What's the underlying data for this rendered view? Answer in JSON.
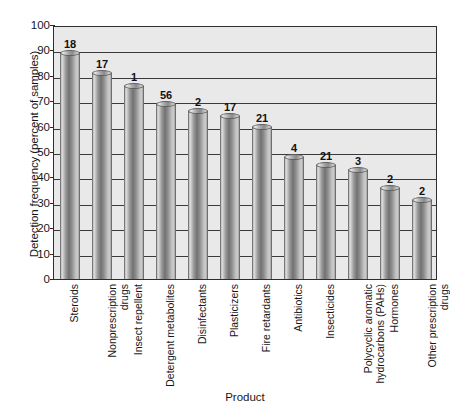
{
  "chart_data": {
    "type": "bar",
    "title": "",
    "xlabel": "Product",
    "ylabel": "Detection frequency (percent of samples)",
    "ylim": [
      0,
      100
    ],
    "ytick_labels": [
      "100",
      "90",
      "80",
      "70",
      "60",
      "50",
      "40",
      "30",
      "20",
      "10",
      "0"
    ],
    "ytick_values": [
      100,
      90,
      80,
      70,
      60,
      50,
      40,
      30,
      20,
      10,
      0
    ],
    "grid": true,
    "legend": null,
    "categories": [
      "Steroids",
      "Nonprescription drugs",
      "Insect repellent",
      "Detergent metabolites",
      "Disinfectants",
      "Plasticizers",
      "Fire retardants",
      "Antibiotics",
      "Insecticides",
      "Polycyclic aromatic hydrocarbons (PAHs)",
      "Hormones",
      "Other prescription drugs"
    ],
    "category_lines": [
      [
        "Steroids"
      ],
      [
        "Nonprescription",
        "drugs"
      ],
      [
        "Insect repellent"
      ],
      [
        "Detergent metabolites"
      ],
      [
        "Disinfectants"
      ],
      [
        "Plasticizers"
      ],
      [
        "Fire retardants"
      ],
      [
        "Antibiotics"
      ],
      [
        "Insecticides"
      ],
      [
        "Polycyclic aromatic",
        "hydrocarbons (PAHs)"
      ],
      [
        "Hormones"
      ],
      [
        "Other prescription",
        "drugs"
      ]
    ],
    "values": [
      89,
      81,
      76,
      69,
      66,
      64,
      60,
      48,
      45,
      43,
      36,
      31
    ],
    "bar_annotations": [
      "18",
      "17",
      "1",
      "56",
      "2",
      "17",
      "21",
      "4",
      "21",
      "3",
      "2",
      "2"
    ],
    "bar_annotation_meaning": "number of compounds measured per product group"
  },
  "axis": {
    "y_title": "Detection frequency (percent of samples)",
    "x_title": "Product"
  },
  "colors": {
    "plot_background": "#e9e9e9",
    "frame": "#2e2e2e",
    "gridline": "#3a3a3a",
    "bar_dark": "#727272",
    "bar_light": "#d8d8d8",
    "text": "#171717"
  }
}
